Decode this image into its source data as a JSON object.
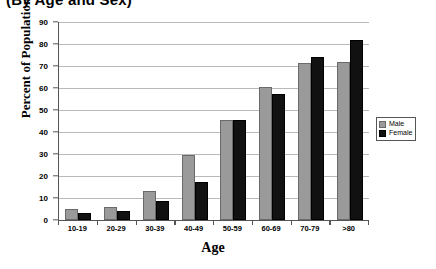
{
  "chart_data": {
    "type": "bar",
    "title": "(By Age and Sex)",
    "xlabel": "Age",
    "ylabel": "Percent of Population",
    "categories": [
      "10-19",
      "20-29",
      "30-39",
      "40-49",
      "50-59",
      "60-69",
      "70-79",
      ">80"
    ],
    "series": [
      {
        "name": "Male",
        "color": "#9a9a9a",
        "values": [
          5,
          6,
          13,
          29.5,
          45.5,
          60.5,
          71.5,
          72
        ]
      },
      {
        "name": "Female",
        "color": "#111111",
        "values": [
          3,
          4,
          8.5,
          17.5,
          45.5,
          57.5,
          74,
          82
        ]
      }
    ],
    "ylim": [
      0,
      90
    ],
    "yticks": [
      0,
      10,
      20,
      30,
      40,
      50,
      60,
      70,
      80,
      90
    ],
    "grid": true,
    "legend_position": "right"
  }
}
